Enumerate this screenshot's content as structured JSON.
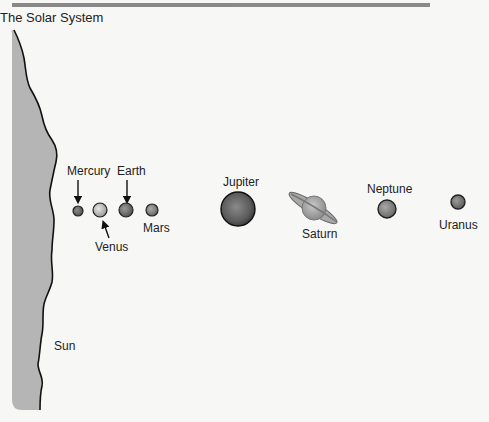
{
  "title": "The Solar System",
  "sun": {
    "label": "Sun",
    "color": "#b5b5b5"
  },
  "planets": [
    {
      "name": "Mercury",
      "label": "Mercury"
    },
    {
      "name": "Venus",
      "label": "Venus"
    },
    {
      "name": "Earth",
      "label": "Earth"
    },
    {
      "name": "Mars",
      "label": "Mars"
    },
    {
      "name": "Jupiter",
      "label": "Jupiter"
    },
    {
      "name": "Saturn",
      "label": "Saturn"
    },
    {
      "name": "Neptune",
      "label": "Neptune"
    },
    {
      "name": "Uranus",
      "label": "Uranus"
    }
  ]
}
